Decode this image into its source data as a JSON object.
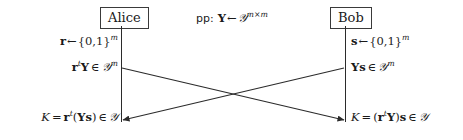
{
  "figure": {
    "type": "protocol-diagram",
    "background_color": "#ffffff",
    "line_color": "#2b2b2b",
    "text_color": "#1a1a1a"
  },
  "parties": {
    "left": {
      "name": "Alice"
    },
    "right": {
      "name": "Bob"
    }
  },
  "public_parameters": {
    "tag": "pp:",
    "variable": "Y",
    "arrow": "←",
    "space": "𝒴",
    "exponent": "m×m",
    "full_text": "pp: Y ← 𝒴^{m×m}"
  },
  "steps": {
    "alice_sample": {
      "variable": "r",
      "arrow": "←",
      "set": "{0,1}",
      "exponent": "m",
      "full_text": "r ← {0,1}^m"
    },
    "bob_sample": {
      "variable": "s",
      "arrow": "←",
      "set": "{0,1}",
      "exponent": "m",
      "full_text": "s ← {0,1}^m"
    },
    "alice_message": {
      "vector": "r",
      "transpose": "t",
      "matrix": "Y",
      "member": "∈",
      "space": "𝒴",
      "exponent": "m",
      "full_text": "r^t Y ∈ 𝒴^m"
    },
    "bob_message": {
      "matrix": "Y",
      "vector": "s",
      "member": "∈",
      "space": "𝒴",
      "exponent": "m",
      "full_text": "Ys ∈ 𝒴^m"
    },
    "alice_key": {
      "key": "K",
      "equals": "=",
      "vector": "r",
      "transpose": "t",
      "open": "(",
      "matrix": "Y",
      "other": "s",
      "close": ")",
      "member": "∈",
      "space": "𝒴",
      "full_text": "K = r^t(Ys) ∈ 𝒴"
    },
    "bob_key": {
      "key": "K",
      "equals": "=",
      "open": "(",
      "vector": "r",
      "transpose": "t",
      "matrix": "Y",
      "close": ")",
      "other": "s",
      "member": "∈",
      "space": "𝒴",
      "full_text": "K = (r^t Y)s ∈ 𝒴"
    }
  },
  "messages": [
    {
      "name": "alice-to-bob",
      "from": "Alice",
      "to": "Bob",
      "direction": "right",
      "label": "r^t Y ∈ 𝒴^m"
    },
    {
      "name": "bob-to-alice",
      "from": "Bob",
      "to": "Alice",
      "direction": "left",
      "label": "Ys ∈ 𝒴^m"
    }
  ]
}
